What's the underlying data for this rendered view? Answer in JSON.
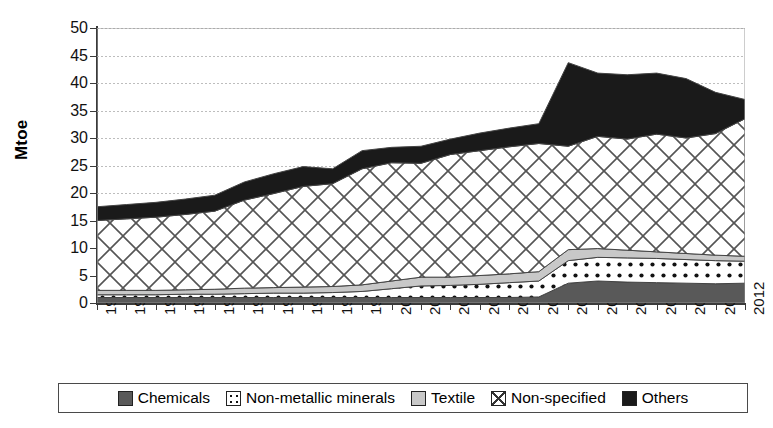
{
  "chart_data": {
    "type": "area",
    "stacked": true,
    "title": "",
    "xlabel": "",
    "ylabel": "Mtoe",
    "ylim": [
      0,
      50
    ],
    "ytick_step": 5,
    "yticks": [
      50,
      45,
      40,
      35,
      30,
      25,
      20,
      15,
      10,
      5,
      0
    ],
    "grid": true,
    "legend_position": "bottom",
    "categories": [
      "1990",
      "1991",
      "1992",
      "1993",
      "1994",
      "1995",
      "1996",
      "1997",
      "1998",
      "1999",
      "2000",
      "2001",
      "2002",
      "2003",
      "2004",
      "2005",
      "2006",
      "2007",
      "2008",
      "2009",
      "2010",
      "2011",
      "2012"
    ],
    "series": [
      {
        "name": "Chemicals",
        "pattern": "solid-dark-gray",
        "color": "#595959",
        "values": [
          1.0,
          1.0,
          1.0,
          1.0,
          1.0,
          1.0,
          1.0,
          1.0,
          1.0,
          1.0,
          1.0,
          1.0,
          1.0,
          1.0,
          1.0,
          1.1,
          3.6,
          4.0,
          3.8,
          3.7,
          3.6,
          3.5,
          3.6
        ]
      },
      {
        "name": "Non-metallic minerals",
        "pattern": "dotted-on-white",
        "color": "#ffffff",
        "values": [
          0.5,
          0.5,
          0.5,
          0.6,
          0.6,
          0.7,
          0.8,
          0.8,
          0.9,
          1.1,
          1.6,
          2.1,
          2.2,
          2.4,
          2.7,
          2.9,
          4.1,
          4.3,
          4.4,
          4.4,
          4.3,
          4.2,
          4.0
        ]
      },
      {
        "name": "Textile",
        "pattern": "solid-light-gray",
        "color": "#c8c8c8",
        "values": [
          0.8,
          0.8,
          0.8,
          0.8,
          0.9,
          1.0,
          1.0,
          1.1,
          1.1,
          1.2,
          1.4,
          1.6,
          1.5,
          1.6,
          1.6,
          1.7,
          2.0,
          1.6,
          1.4,
          1.2,
          1.1,
          1.0,
          0.9
        ]
      },
      {
        "name": "Non-specified",
        "pattern": "crosshatch",
        "color": "#ffffff",
        "values": [
          12.7,
          13.0,
          13.3,
          13.7,
          14.2,
          16.0,
          17.1,
          18.3,
          18.7,
          21.1,
          21.5,
          20.7,
          22.3,
          22.7,
          23.1,
          23.3,
          18.8,
          20.4,
          20.2,
          21.4,
          21.0,
          22.1,
          25.0
        ]
      },
      {
        "name": "Others",
        "pattern": "solid-black",
        "color": "#1a1a1a",
        "values": [
          2.5,
          2.6,
          2.7,
          2.8,
          2.9,
          3.3,
          3.6,
          3.6,
          2.7,
          3.3,
          2.8,
          3.1,
          2.8,
          3.2,
          3.4,
          3.6,
          15.2,
          11.5,
          11.7,
          11.1,
          10.8,
          7.5,
          3.5
        ]
      }
    ],
    "totals": [
      17.5,
      17.9,
      18.3,
      18.9,
      19.6,
      22.0,
      23.5,
      24.8,
      24.4,
      27.7,
      28.3,
      28.5,
      29.8,
      30.9,
      31.8,
      32.6,
      43.7,
      41.8,
      41.5,
      41.8,
      40.8,
      38.3,
      37.0
    ]
  },
  "legend": {
    "items": [
      {
        "label": "Chemicals",
        "swatch": "chemicals-swatch"
      },
      {
        "label": "Non-metallic minerals",
        "swatch": "non-metallic-minerals-swatch"
      },
      {
        "label": "Textile",
        "swatch": "textile-swatch"
      },
      {
        "label": "Non-specified",
        "swatch": "non-specified-swatch"
      },
      {
        "label": "Others",
        "swatch": "others-swatch"
      }
    ]
  }
}
